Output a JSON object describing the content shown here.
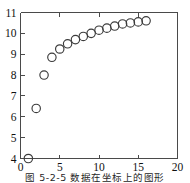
{
  "figure": {
    "caption": "图 5-2-5   数据在坐标上的图形",
    "background_color": "#ffffff",
    "axis_color": "#4a4a4a",
    "marker_color": "#3b3b3b"
  },
  "chart_data": {
    "type": "scatter",
    "title": "",
    "xlabel": "",
    "ylabel": "",
    "xlim": [
      0,
      20
    ],
    "ylim": [
      4,
      11
    ],
    "xticks": [
      0,
      5,
      10,
      15,
      20
    ],
    "yticks": [
      4,
      5,
      6,
      7,
      8,
      9,
      10,
      11
    ],
    "xtick_labels": [
      "0",
      "5",
      "10",
      "15",
      "20"
    ],
    "ytick_labels": [
      "4",
      "5",
      "6",
      "7",
      "8",
      "9",
      "10",
      "11"
    ],
    "xminor_step": 1,
    "yminor_step": 1,
    "grid": false,
    "legend": null,
    "marker": "open-circle",
    "marker_size": 4.2,
    "x": [
      1,
      2,
      3,
      4,
      5,
      6,
      7,
      8,
      9,
      10,
      11,
      12,
      13,
      14,
      15,
      16
    ],
    "y": [
      4.0,
      6.4,
      8.0,
      8.85,
      9.25,
      9.5,
      9.7,
      9.85,
      10.0,
      10.15,
      10.25,
      10.35,
      10.45,
      10.5,
      10.55,
      10.6
    ],
    "series": [
      {
        "name": "data",
        "x": [
          1,
          2,
          3,
          4,
          5,
          6,
          7,
          8,
          9,
          10,
          11,
          12,
          13,
          14,
          15,
          16
        ],
        "values": [
          4.0,
          6.4,
          8.0,
          8.85,
          9.25,
          9.5,
          9.7,
          9.85,
          10.0,
          10.15,
          10.25,
          10.35,
          10.45,
          10.5,
          10.55,
          10.6
        ]
      }
    ]
  }
}
